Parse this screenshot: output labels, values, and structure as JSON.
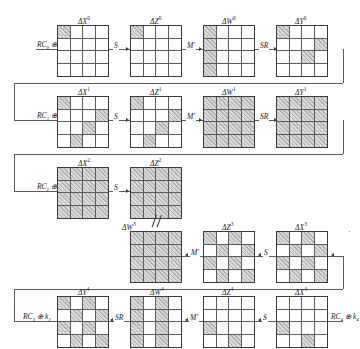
{
  "figure": {
    "shade_color": "#d9d9d9",
    "line_color": "#5b5b5b",
    "grid_size": 4
  },
  "rounds": [
    {
      "id": "round-0",
      "direction": "ltr",
      "input_op": {
        "name": "rc-xor-k-0",
        "text": "RC₀ ⊕ k₀"
      },
      "states": [
        {
          "name": "delta-x-0",
          "label": "ΔX",
          "sup": "0",
          "cells": [
            1,
            0,
            0,
            0,
            0,
            0,
            0,
            0,
            0,
            0,
            0,
            0,
            0,
            0,
            0,
            0
          ]
        },
        {
          "name": "delta-z-0",
          "label": "ΔZ",
          "sup": "0",
          "cells": [
            1,
            0,
            0,
            0,
            0,
            0,
            0,
            0,
            0,
            0,
            0,
            0,
            0,
            0,
            0,
            0
          ]
        },
        {
          "name": "delta-w-0",
          "label": "ΔW",
          "sup": "0",
          "cells": [
            1,
            0,
            0,
            0,
            1,
            0,
            0,
            0,
            1,
            0,
            0,
            0,
            1,
            0,
            0,
            0
          ]
        },
        {
          "name": "delta-y-0",
          "label": "ΔY",
          "sup": "0",
          "cells": [
            1,
            0,
            0,
            0,
            0,
            0,
            0,
            1,
            0,
            0,
            1,
            0,
            0,
            0,
            0,
            0
          ]
        }
      ],
      "ops": [
        {
          "name": "sbox-op",
          "text": "S"
        },
        {
          "name": "mixcolumns-op",
          "text": "M′"
        },
        {
          "name": "shiftrows-op",
          "text": "SR"
        }
      ]
    },
    {
      "id": "round-1",
      "direction": "ltr",
      "input_op": {
        "name": "rc-xor-k-1",
        "text": "RC₁ ⊕ k₁"
      },
      "states": [
        {
          "name": "delta-x-1",
          "label": "ΔX",
          "sup": "1",
          "cells": [
            1,
            0,
            0,
            0,
            0,
            0,
            0,
            1,
            0,
            0,
            1,
            0,
            0,
            1,
            0,
            0
          ]
        },
        {
          "name": "delta-z-1",
          "label": "ΔZ",
          "sup": "1",
          "cells": [
            1,
            0,
            0,
            0,
            0,
            0,
            0,
            1,
            0,
            0,
            1,
            0,
            0,
            1,
            0,
            0
          ]
        },
        {
          "name": "delta-w-1",
          "label": "ΔW",
          "sup": "1",
          "cells": [
            1,
            1,
            1,
            1,
            1,
            1,
            1,
            1,
            1,
            1,
            1,
            1,
            1,
            1,
            1,
            1
          ]
        },
        {
          "name": "delta-y-1",
          "label": "ΔY",
          "sup": "1",
          "cells": [
            1,
            1,
            1,
            1,
            1,
            1,
            1,
            1,
            1,
            1,
            1,
            1,
            1,
            1,
            1,
            1
          ]
        }
      ],
      "ops": [
        {
          "name": "sbox-op",
          "text": "S"
        },
        {
          "name": "mixcolumns-op",
          "text": "M′"
        },
        {
          "name": "shiftrows-op",
          "text": "SR"
        }
      ]
    },
    {
      "id": "round-2",
      "direction": "ltr",
      "input_op": {
        "name": "rc-xor-k-2",
        "text": "RC₂ ⊕ k₂"
      },
      "states": [
        {
          "name": "delta-x-2",
          "label": "ΔX",
          "sup": "2",
          "cells": [
            1,
            1,
            1,
            1,
            1,
            1,
            1,
            1,
            1,
            1,
            1,
            1,
            1,
            1,
            1,
            1
          ]
        },
        {
          "name": "delta-z-2",
          "label": "ΔZ",
          "sup": "2",
          "cells": [
            1,
            1,
            1,
            1,
            1,
            1,
            1,
            1,
            1,
            1,
            1,
            1,
            1,
            1,
            1,
            1
          ]
        }
      ],
      "ops": [
        {
          "name": "sbox-op",
          "text": "S"
        }
      ]
    },
    {
      "id": "round-3",
      "direction": "rtl",
      "states": [
        {
          "name": "delta-w-3",
          "label": "ΔW",
          "sup": "3",
          "cells": [
            1,
            1,
            1,
            1,
            1,
            1,
            1,
            1,
            1,
            1,
            1,
            1,
            1,
            1,
            1,
            1
          ]
        },
        {
          "name": "delta-z-3",
          "label": "ΔZ",
          "sup": "3",
          "cells": [
            1,
            0,
            1,
            0,
            0,
            1,
            0,
            1,
            1,
            0,
            1,
            0,
            0,
            1,
            0,
            1
          ]
        },
        {
          "name": "delta-x-3",
          "label": "ΔX",
          "sup": "3",
          "cells": [
            1,
            0,
            1,
            0,
            0,
            1,
            0,
            1,
            1,
            0,
            1,
            0,
            0,
            1,
            0,
            1
          ]
        }
      ],
      "ops": [
        {
          "name": "mixcolumns-op",
          "text": "M′"
        },
        {
          "name": "sbox-op",
          "text": "S"
        }
      ],
      "annotation": {
        "name": "not-parallel-mark",
        "text": ""
      }
    },
    {
      "id": "round-4",
      "direction": "rtl",
      "input_op": {
        "name": "rc-xor-k-4",
        "text": "RC₄ ⊕ k₄"
      },
      "output_op": {
        "name": "rc-xor-k-3",
        "text": "RC₃ ⊕ k₃"
      },
      "states": [
        {
          "name": "delta-y-4",
          "label": "ΔY",
          "sup": "4",
          "cells": [
            1,
            0,
            1,
            0,
            0,
            1,
            0,
            1,
            1,
            0,
            1,
            0,
            0,
            1,
            0,
            1
          ]
        },
        {
          "name": "delta-w-4",
          "label": "ΔW",
          "sup": "4",
          "cells": [
            1,
            0,
            1,
            0,
            1,
            0,
            1,
            0,
            1,
            0,
            1,
            0,
            1,
            0,
            1,
            0
          ]
        },
        {
          "name": "delta-z-4",
          "label": "ΔZ",
          "sup": "4",
          "cells": [
            0,
            0,
            0,
            0,
            0,
            0,
            0,
            0,
            1,
            0,
            0,
            0,
            0,
            0,
            1,
            0
          ]
        },
        {
          "name": "delta-x-4",
          "label": "ΔX",
          "sup": "4",
          "cells": [
            0,
            0,
            0,
            0,
            0,
            0,
            0,
            0,
            1,
            0,
            0,
            0,
            0,
            0,
            1,
            0
          ]
        }
      ],
      "ops": [
        {
          "name": "shiftrows-op",
          "text": "SR"
        },
        {
          "name": "mixcolumns-op",
          "text": "M′"
        },
        {
          "name": "sbox-op",
          "text": "S"
        }
      ]
    }
  ]
}
